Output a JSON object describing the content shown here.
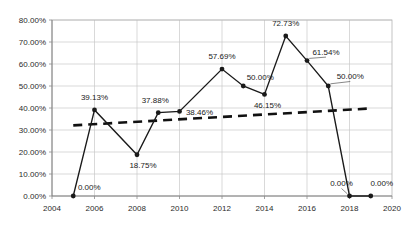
{
  "chart_data": {
    "type": "line",
    "title": "",
    "subtitle": "",
    "xlabel": "",
    "ylabel": "",
    "xlim": [
      2004,
      2020
    ],
    "ylim": [
      0,
      0.8
    ],
    "grid": true,
    "legend": null,
    "x_tick_labels": [
      "2004",
      "2006",
      "2008",
      "2010",
      "2012",
      "2014",
      "2016",
      "2018",
      "2020"
    ],
    "x_tick_values": [
      2004,
      2006,
      2008,
      2010,
      2012,
      2014,
      2016,
      2018,
      2020
    ],
    "y_tick_labels": [
      "0.00%",
      "10.00%",
      "20.00%",
      "30.00%",
      "40.00%",
      "50.00%",
      "60.00%",
      "70.00%",
      "80.00%"
    ],
    "y_tick_values": [
      0,
      0.1,
      0.2,
      0.3,
      0.4,
      0.5,
      0.6,
      0.7,
      0.8
    ],
    "series": [
      {
        "name": "data",
        "x": [
          2005,
          2006,
          2008,
          2009,
          2010,
          2012,
          2013,
          2014,
          2015,
          2016,
          2017,
          2018,
          2019
        ],
        "values": [
          0.0,
          0.3913,
          0.1875,
          0.3788,
          0.3846,
          0.5769,
          0.5,
          0.4615,
          0.7273,
          0.6154,
          0.5,
          0.0,
          0.0
        ],
        "data_labels": [
          "0.00%",
          "39.13%",
          "18.75%",
          "37.88%",
          "38.46%",
          "57.69%",
          "50.00%",
          "46.15%",
          "72.73%",
          "61.54%",
          "50.00%",
          "0.00%",
          "0.00%"
        ],
        "marker": "circle",
        "color": "#1a1a1a"
      },
      {
        "name": "trendline",
        "style": "dashed",
        "x": [
          2005,
          2019
        ],
        "values": [
          0.321,
          0.398
        ],
        "color": "#111111"
      }
    ]
  }
}
